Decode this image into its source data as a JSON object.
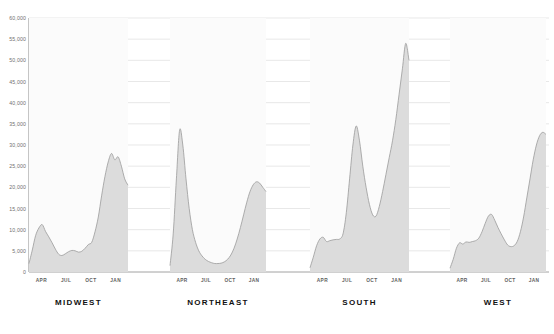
{
  "chart_data": {
    "type": "area",
    "title": "",
    "xlabel": "",
    "ylabel": "",
    "ylim": [
      0,
      60000
    ],
    "grid": true,
    "legend_position": "none",
    "y_ticks": [
      0,
      5000,
      10000,
      15000,
      20000,
      25000,
      30000,
      35000,
      40000,
      45000,
      50000,
      55000,
      60000
    ],
    "y_tick_labels": [
      "0",
      "5,000",
      "10,000",
      "15,000",
      "20,000",
      "25,000",
      "30,000",
      "35,000",
      "40,000",
      "45,000",
      "50,000",
      "55,000",
      "60,000"
    ],
    "x_tick_labels": [
      "APR",
      "JUL",
      "OCT",
      "JAN"
    ],
    "panel_labels": [
      "MIDWEST",
      "NORTHEAST",
      "SOUTH",
      "WEST"
    ],
    "colors": {
      "fill": "#dcdcdc",
      "line": "#9a9a9a",
      "grid": "#d8d8d8",
      "axis": "#8a8a8a",
      "text": "#5e5e5e",
      "title_text": "#111111"
    },
    "panels": [
      {
        "name": "MIDWEST",
        "x_tick_labels": [
          "APR",
          "JUL",
          "OCT",
          "JAN"
        ],
        "values": [
          2000,
          5200,
          8600,
          10400,
          11200,
          9600,
          8300,
          6900,
          5400,
          4200,
          3900,
          4300,
          4800,
          5100,
          5000,
          4700,
          4900,
          5600,
          6500,
          7000,
          9500,
          13000,
          18000,
          22500,
          26000,
          28000,
          26500,
          27200,
          25000,
          22000,
          20500
        ]
      },
      {
        "name": "NORTHEAST",
        "x_tick_labels": [
          "APR",
          "JUL",
          "OCT",
          "JAN"
        ],
        "values": [
          1500,
          9000,
          22000,
          33500,
          30000,
          22000,
          15000,
          10000,
          7000,
          5000,
          3800,
          3000,
          2500,
          2200,
          2000,
          2000,
          2100,
          2400,
          3000,
          4000,
          5600,
          7800,
          10500,
          13500,
          16500,
          19000,
          20600,
          21300,
          21000,
          20000,
          19000
        ]
      },
      {
        "name": "SOUTH",
        "x_tick_labels": [
          "APR",
          "JUL",
          "OCT",
          "JAN"
        ],
        "values": [
          1000,
          3500,
          6200,
          7800,
          8200,
          7200,
          7400,
          7600,
          7700,
          7800,
          9000,
          14000,
          22000,
          30000,
          34500,
          31000,
          25000,
          20000,
          16000,
          13500,
          13200,
          15500,
          19000,
          23000,
          27000,
          31000,
          36000,
          42000,
          48000,
          54000,
          50000
        ]
      },
      {
        "name": "WEST",
        "x_tick_labels": [
          "APR",
          "JUL",
          "OCT",
          "JAN"
        ],
        "values": [
          900,
          3000,
          5600,
          6900,
          6600,
          7100,
          7000,
          7200,
          7400,
          8000,
          9500,
          11500,
          13200,
          13600,
          12200,
          10500,
          9000,
          7600,
          6400,
          6000,
          6200,
          7200,
          9500,
          13000,
          17500,
          22000,
          26500,
          30000,
          32200,
          33000,
          32500
        ]
      }
    ]
  }
}
